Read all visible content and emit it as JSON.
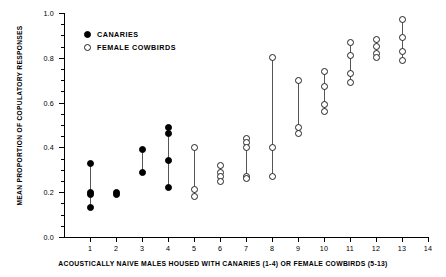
{
  "chart_data": {
    "type": "scatter",
    "title": "",
    "xlabel": "ACOUSTICALLY NAIVE MALES HOUSED WITH CANARIES (1-4) OR FEMALE COWBIRDS (5-13)",
    "ylabel": "MEAN PROPORTION OF COPULATORY RESPONSES",
    "ylim": [
      0.0,
      1.0
    ],
    "xlim": [
      0,
      14
    ],
    "yticks": [
      "0.0",
      "0.2",
      "0.4",
      "0.6",
      "0.8",
      "1.0"
    ],
    "ytick_values": [
      0.0,
      0.2,
      0.4,
      0.6,
      0.8,
      1.0
    ],
    "y_minor_interval": 0.05,
    "xticks": [
      "1",
      "2",
      "3",
      "4",
      "5",
      "6",
      "7",
      "8",
      "9",
      "10",
      "11",
      "12",
      "13",
      "14"
    ],
    "xtick_values": [
      1,
      2,
      3,
      4,
      5,
      6,
      7,
      8,
      9,
      10,
      11,
      12,
      13,
      14
    ],
    "grid": false,
    "legend_position": "upper-left-inside",
    "legend": [
      {
        "label": "CANARIES",
        "marker": "filled-circle",
        "color": "#000000"
      },
      {
        "label": "FEMALE COWBIRDS",
        "marker": "open-circle",
        "color": "#000000"
      }
    ],
    "series": [
      {
        "name": "CANARIES",
        "marker": "filled-circle",
        "subjects": [
          {
            "x": 1,
            "values": [
              0.33,
              0.2,
              0.19,
              0.13
            ]
          },
          {
            "x": 2,
            "values": [
              0.2,
              0.19
            ]
          },
          {
            "x": 3,
            "values": [
              0.39,
              0.29
            ]
          },
          {
            "x": 4,
            "values": [
              0.49,
              0.46,
              0.34,
              0.22
            ]
          }
        ]
      },
      {
        "name": "FEMALE COWBIRDS",
        "marker": "open-circle",
        "subjects": [
          {
            "x": 5,
            "values": [
              0.4,
              0.21,
              0.18
            ]
          },
          {
            "x": 6,
            "values": [
              0.32,
              0.29,
              0.27,
              0.25
            ]
          },
          {
            "x": 7,
            "values": [
              0.44,
              0.42,
              0.4,
              0.27,
              0.26
            ]
          },
          {
            "x": 8,
            "values": [
              0.8,
              0.4,
              0.27
            ]
          },
          {
            "x": 9,
            "values": [
              0.7,
              0.49,
              0.46
            ]
          },
          {
            "x": 10,
            "values": [
              0.74,
              0.67,
              0.59,
              0.56
            ]
          },
          {
            "x": 11,
            "values": [
              0.87,
              0.81,
              0.73,
              0.69
            ]
          },
          {
            "x": 12,
            "values": [
              0.88,
              0.85,
              0.82,
              0.8
            ]
          },
          {
            "x": 13,
            "values": [
              0.97,
              0.89,
              0.83,
              0.79
            ]
          }
        ]
      }
    ]
  },
  "axes": {
    "x_label": "ACOUSTICALLY NAIVE MALES HOUSED WITH CANARIES (1-4) OR FEMALE COWBIRDS (5-13)",
    "y_label": "MEAN PROPORTION OF COPULATORY RESPONSES"
  }
}
